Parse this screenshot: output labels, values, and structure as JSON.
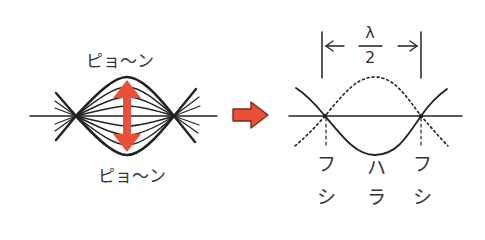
{
  "diagram": {
    "left": {
      "label_top": "ピョ〜ン",
      "label_bottom": "ピョ〜ン",
      "arrow_color": "#e8503a"
    },
    "transition_arrow_color": "#e8503a",
    "right": {
      "wavelength_label_numerator": "λ",
      "wavelength_label_denominator": "2",
      "node_labels": [
        {
          "top": "フ",
          "bottom": "シ"
        },
        {
          "top": "ハ",
          "bottom": "ラ"
        },
        {
          "top": "フ",
          "bottom": "シ"
        }
      ]
    }
  }
}
